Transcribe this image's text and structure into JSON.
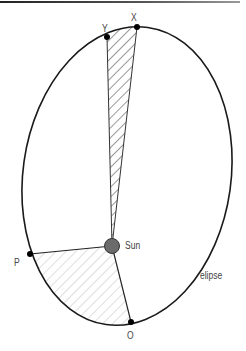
{
  "diagram": {
    "title": "",
    "labels": {
      "x": "X",
      "y": "Y",
      "p": "P",
      "o": "O",
      "sun": "Sun",
      "ellipse": "elipse"
    },
    "colors": {
      "line": "#1a1a1a",
      "sun_fill": "#6b6b6b",
      "hatch_dark": "#333333",
      "hatch_light": "#c8c8c8",
      "label": "#444444"
    },
    "points": {
      "X": [
        137,
        27
      ],
      "Y": [
        107,
        37
      ],
      "P": [
        30,
        254
      ],
      "O": [
        131,
        322
      ],
      "Sun": [
        112,
        246
      ]
    }
  }
}
